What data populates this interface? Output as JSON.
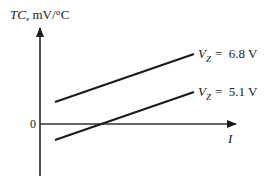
{
  "diagram": {
    "y_axis_label": {
      "italic": "TC",
      "rest": ", mV/°C"
    },
    "x_axis_label": "I",
    "origin_label": "0",
    "lines": [
      {
        "name": "vz-6.8",
        "label_var": "V",
        "label_sub": "Z",
        "label_eq": "=  6.8 V",
        "x1": 55,
        "y1": 102,
        "x2": 194,
        "y2": 54
      },
      {
        "name": "vz-5.1",
        "label_var": "V",
        "label_sub": "Z",
        "label_eq": "=  5.1 V",
        "x1": 55,
        "y1": 140,
        "x2": 194,
        "y2": 92
      }
    ],
    "colors": {
      "ink": "#1a1a1a",
      "axis": "#333333"
    }
  }
}
